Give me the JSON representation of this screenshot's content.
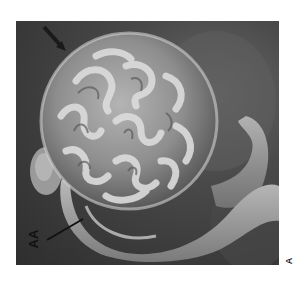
{
  "figure": {
    "type": "scanning electron micrograph",
    "colors": {
      "background": "#3a3a3a",
      "structure_light": "#c8c8c8",
      "structure_mid": "#8e8e8e",
      "structure_dark": "#555555"
    }
  },
  "labels": {
    "pointer_label": "AA",
    "panel_label": "A"
  },
  "annotations": {
    "arrow": "dark diagonal arrow, upper left"
  }
}
